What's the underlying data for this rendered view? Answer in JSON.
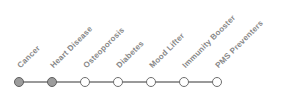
{
  "timeline": {
    "steps": [
      {
        "label": "Cancer",
        "state": "filled"
      },
      {
        "label": "Heart Disease",
        "state": "filled"
      },
      {
        "label": "Osteoporosis",
        "state": "open"
      },
      {
        "label": "Diabetes",
        "state": "open"
      },
      {
        "label": "Mood Lifter",
        "state": "open"
      },
      {
        "label": "Immunity Booster",
        "state": "open"
      },
      {
        "label": "PMS Preventers",
        "state": "open"
      }
    ],
    "colors": {
      "line": "#999999",
      "dot_filled_fill": "#9c9c9c",
      "dot_filled_border": "#5f5f5f",
      "dot_open_fill": "#ffffff",
      "dot_open_border": "#6e6e6e",
      "label_text": "#878787"
    }
  }
}
